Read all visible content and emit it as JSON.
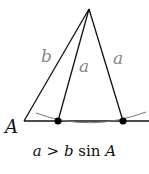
{
  "diagram": {
    "type": "ambiguous-case-triangle",
    "labels": {
      "side_b": "b",
      "side_a_left": "a",
      "side_a_right": "a",
      "vertex_A": "A"
    },
    "colors": {
      "lines": "#111111",
      "side_labels": "#888888",
      "arc": "#777777",
      "points": "#000000"
    },
    "caption": {
      "var_a": "a",
      "op": ">",
      "var_b": "b",
      "func": "sin",
      "var_A": "A"
    }
  }
}
